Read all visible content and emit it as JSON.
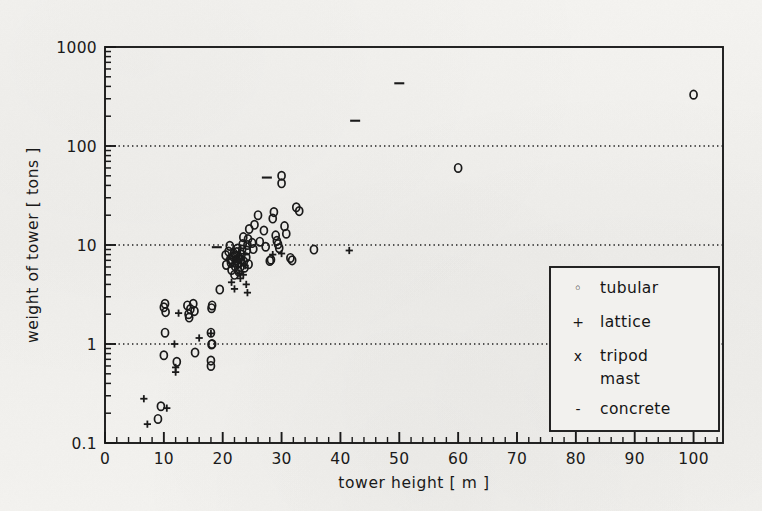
{
  "figure": {
    "background_color": "#f2f1ee",
    "ink_color": "#1a1a1a",
    "frame": {
      "left": 105,
      "right": 723,
      "top": 47,
      "bottom": 443
    }
  },
  "chart_data": {
    "type": "scatter",
    "title": "",
    "xlabel": "tower height  [ m ]",
    "ylabel": "weight of tower  [ tons ]",
    "xscale": "linear",
    "yscale": "log",
    "xlim": [
      0,
      105
    ],
    "ylim": [
      0.1,
      1000
    ],
    "xticks": [
      0,
      10,
      20,
      30,
      40,
      50,
      60,
      70,
      80,
      90,
      100
    ],
    "xtick_labels": [
      "0",
      "10",
      "20",
      "30",
      "40",
      "50",
      "60",
      "70",
      "80",
      "90",
      "100"
    ],
    "x_minor_tick_step": 2,
    "yticks": [
      0.1,
      1,
      10,
      100,
      1000
    ],
    "ytick_labels": [
      "0.1",
      "1",
      "10",
      "100",
      "1000"
    ],
    "grid": "horizontal dotted at 1, 10, 100",
    "gridlines_y": [
      1,
      10,
      100
    ],
    "legend_position": "lower right inside axes",
    "legend_entries": [
      {
        "symbol": "o",
        "symbol_name": "circle-marker",
        "label": "tubular"
      },
      {
        "symbol": "+",
        "symbol_name": "plus-marker",
        "label": "lattice"
      },
      {
        "symbol": "x",
        "symbol_name": "cross-marker",
        "label": "tripod",
        "label2": "mast"
      },
      {
        "symbol": "-",
        "symbol_name": "dash-marker",
        "label": "concrete"
      }
    ],
    "series": [
      {
        "name": "tubular",
        "marker": "o",
        "points": [
          [
            9.0,
            0.175
          ],
          [
            9.5,
            0.235
          ],
          [
            10.0,
            0.77
          ],
          [
            10.2,
            1.3
          ],
          [
            10.0,
            2.35
          ],
          [
            10.2,
            2.55
          ],
          [
            10.3,
            2.1
          ],
          [
            12.2,
            0.66
          ],
          [
            14.0,
            2.45
          ],
          [
            14.2,
            2.0
          ],
          [
            14.3,
            1.85
          ],
          [
            14.5,
            2.25
          ],
          [
            15.0,
            2.55
          ],
          [
            15.2,
            2.15
          ],
          [
            15.3,
            0.82
          ],
          [
            18.0,
            0.6
          ],
          [
            18.0,
            0.68
          ],
          [
            18.1,
            0.99
          ],
          [
            18.2,
            1.0
          ],
          [
            18.0,
            1.3
          ],
          [
            18.1,
            2.3
          ],
          [
            18.2,
            2.45
          ],
          [
            19.5,
            3.55
          ],
          [
            20.5,
            7.9
          ],
          [
            20.6,
            6.3
          ],
          [
            21.0,
            8.6
          ],
          [
            21.2,
            9.8
          ],
          [
            21.3,
            7.2
          ],
          [
            21.4,
            6.6
          ],
          [
            21.5,
            5.6
          ],
          [
            21.6,
            6.9
          ],
          [
            21.8,
            7.6
          ],
          [
            21.9,
            8.2
          ],
          [
            22.0,
            5.0
          ],
          [
            22.1,
            6.1
          ],
          [
            22.2,
            7.0
          ],
          [
            22.3,
            7.8
          ],
          [
            22.4,
            8.5
          ],
          [
            22.5,
            9.2
          ],
          [
            22.6,
            6.6
          ],
          [
            22.7,
            5.4
          ],
          [
            22.8,
            7.4
          ],
          [
            23.0,
            6.0
          ],
          [
            23.1,
            7.1
          ],
          [
            23.2,
            8.0
          ],
          [
            23.3,
            9.0
          ],
          [
            23.4,
            10.2
          ],
          [
            23.5,
            12.0
          ],
          [
            23.6,
            6.8
          ],
          [
            23.7,
            5.9
          ],
          [
            24.0,
            7.5
          ],
          [
            24.1,
            8.8
          ],
          [
            24.2,
            10.0
          ],
          [
            24.3,
            11.5
          ],
          [
            24.4,
            6.4
          ],
          [
            24.5,
            14.5
          ],
          [
            25.0,
            10.5
          ],
          [
            25.2,
            9.1
          ],
          [
            25.4,
            16.0
          ],
          [
            26.0,
            20.0
          ],
          [
            26.3,
            10.8
          ],
          [
            27.0,
            14.0
          ],
          [
            27.3,
            9.6
          ],
          [
            28.0,
            6.9
          ],
          [
            28.2,
            7.1
          ],
          [
            28.5,
            18.5
          ],
          [
            28.7,
            21.5
          ],
          [
            29.0,
            12.5
          ],
          [
            29.2,
            11.0
          ],
          [
            29.4,
            10.2
          ],
          [
            29.6,
            9.3
          ],
          [
            30.0,
            50.0
          ],
          [
            30.0,
            42.0
          ],
          [
            30.5,
            15.5
          ],
          [
            30.8,
            13.0
          ],
          [
            31.5,
            7.4
          ],
          [
            31.8,
            7.0
          ],
          [
            32.5,
            24.0
          ],
          [
            33.0,
            22.0
          ],
          [
            35.5,
            9.0
          ],
          [
            60.0,
            60.0
          ],
          [
            100.0,
            330.0
          ]
        ]
      },
      {
        "name": "lattice",
        "marker": "+",
        "points": [
          [
            6.6,
            0.28
          ],
          [
            7.2,
            0.155
          ],
          [
            10.5,
            0.225
          ],
          [
            11.8,
            1.0
          ],
          [
            12.0,
            0.58
          ],
          [
            12.0,
            0.52
          ],
          [
            12.5,
            2.05
          ],
          [
            16.0,
            1.15
          ],
          [
            18.0,
            1.28
          ],
          [
            21.5,
            4.2
          ],
          [
            22.0,
            3.6
          ],
          [
            22.5,
            6.0
          ],
          [
            22.6,
            6.8
          ],
          [
            22.8,
            5.2
          ],
          [
            23.0,
            4.6
          ],
          [
            23.2,
            7.3
          ],
          [
            23.5,
            5.0
          ],
          [
            23.8,
            6.2
          ],
          [
            24.0,
            4.0
          ],
          [
            24.2,
            3.3
          ],
          [
            28.5,
            8.0
          ],
          [
            30.0,
            8.2
          ],
          [
            41.5,
            8.8
          ]
        ]
      },
      {
        "name": "tripod mast",
        "marker": "x",
        "points": []
      },
      {
        "name": "concrete",
        "marker": "-",
        "points": [
          [
            19.0,
            9.5
          ],
          [
            27.5,
            48.0
          ],
          [
            42.5,
            180.0
          ],
          [
            50.0,
            430.0
          ]
        ]
      }
    ]
  }
}
